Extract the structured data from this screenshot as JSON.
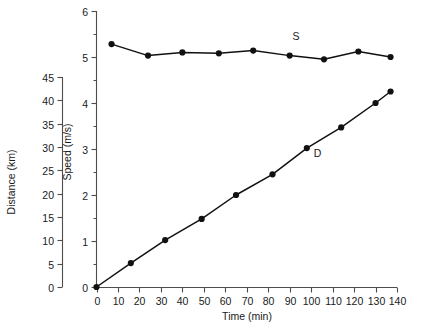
{
  "chart_data": {
    "type": "line",
    "title": "",
    "xlabel": "Time (min)",
    "ylabel": "Speed (m/s)",
    "y2label": "Distance (km)",
    "xlim": [
      0,
      140
    ],
    "ylim": [
      0,
      6
    ],
    "y2lim": [
      0,
      45
    ],
    "grid": false,
    "legend_position": "inline-annotation",
    "xticks": [
      0,
      10,
      20,
      30,
      40,
      50,
      60,
      70,
      80,
      90,
      100,
      110,
      120,
      130,
      140
    ],
    "yticks": [
      0,
      1,
      2,
      3,
      4,
      5,
      6
    ],
    "yminorticks": [
      0.5,
      1.5,
      2.5,
      3.5,
      4.5,
      5.5
    ],
    "y2ticks": [
      0,
      5,
      10,
      15,
      20,
      25,
      30,
      35,
      40,
      45
    ],
    "series": [
      {
        "name": "S",
        "label": "S",
        "axis": "left",
        "marker": "filled-circle",
        "x": [
          7,
          24,
          40,
          57,
          73,
          90,
          106,
          122,
          137
        ],
        "values": [
          5.28,
          5.03,
          5.1,
          5.08,
          5.14,
          5.03,
          4.95,
          5.12,
          5.0
        ]
      },
      {
        "name": "D",
        "label": "D",
        "axis": "left",
        "marker": "filled-circle",
        "x": [
          0,
          16,
          32,
          49,
          65,
          82,
          98,
          114,
          130,
          137
        ],
        "values": [
          0,
          0.52,
          1.02,
          1.48,
          2.0,
          2.45,
          3.02,
          3.47,
          4.0,
          4.25
        ]
      }
    ],
    "annotations": [
      {
        "text": "S",
        "x": 93,
        "y": 5.38
      },
      {
        "text": "D",
        "x": 103,
        "y": 2.82
      }
    ]
  },
  "axes": {
    "x_title": "Time (min)",
    "y_inner_title": "Speed (m/s)",
    "y_outer_title": "Distance (km)",
    "x_tick_labels": [
      "0",
      "10",
      "20",
      "30",
      "40",
      "50",
      "60",
      "70",
      "80",
      "90",
      "100",
      "110",
      "120",
      "130",
      "140"
    ],
    "y_inner_tick_labels": [
      "0",
      "1",
      "2",
      "3",
      "4",
      "5",
      "6"
    ],
    "y_outer_tick_labels": [
      "0",
      "5",
      "10",
      "15",
      "20",
      "25",
      "30",
      "35",
      "40",
      "45"
    ]
  },
  "colors": {
    "data": "#111111",
    "axis": "#4d4d4d",
    "background": "#ffffff",
    "text": "#1a1a1a"
  }
}
